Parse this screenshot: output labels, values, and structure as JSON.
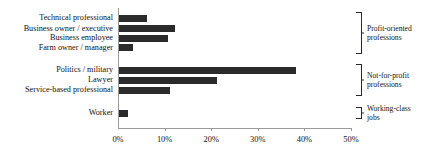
{
  "chart_data": {
    "type": "bar",
    "orientation": "horizontal",
    "title": "",
    "xlabel": "",
    "ylabel": "",
    "categories": [
      "Technical professional",
      "Business owner / executive",
      "Business employee",
      "Farm owner / manager",
      "Politics / military",
      "Lawyer",
      "Service-based professional",
      "Worker"
    ],
    "values": [
      6,
      12,
      10.5,
      3,
      38,
      21,
      11,
      2
    ],
    "xlim": [
      0,
      50
    ],
    "xticks": [
      0,
      10,
      20,
      30,
      40,
      50
    ],
    "xtick_labels": [
      "0%",
      "10%",
      "20%",
      "30%",
      "40%",
      "50%"
    ],
    "grid": false,
    "legend": false,
    "bar_color": "#2b2b2b",
    "axis_color": "#9a9a9a",
    "groups": [
      {
        "label_line1": "Profit-oriented",
        "label_line2": "professions",
        "categories": [
          "Technical professional",
          "Business owner / executive",
          "Business employee",
          "Farm owner / manager"
        ]
      },
      {
        "label_line1": "Not-for-profit",
        "label_line2": "professions",
        "categories": [
          "Politics / military",
          "Lawyer",
          "Service-based professional"
        ]
      },
      {
        "label_line1": "Working-class",
        "label_line2": "jobs",
        "categories": [
          "Worker"
        ]
      }
    ]
  }
}
